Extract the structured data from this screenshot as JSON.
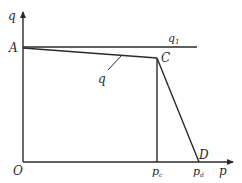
{
  "diagram": {
    "type": "line-diagram",
    "axes": {
      "y_label": "q",
      "x_label": "p",
      "origin_label": "O"
    },
    "points": {
      "A": "A",
      "C": "C",
      "D": "D"
    },
    "curves": {
      "q1_label_main": "q",
      "q1_label_sub": "1",
      "q_label": "q"
    },
    "x_ticks": [
      {
        "main": "p",
        "sub": "c"
      },
      {
        "main": "p",
        "sub": "d"
      }
    ],
    "colors": {
      "line": "#2a2a2a",
      "background": "#ffffff"
    }
  }
}
